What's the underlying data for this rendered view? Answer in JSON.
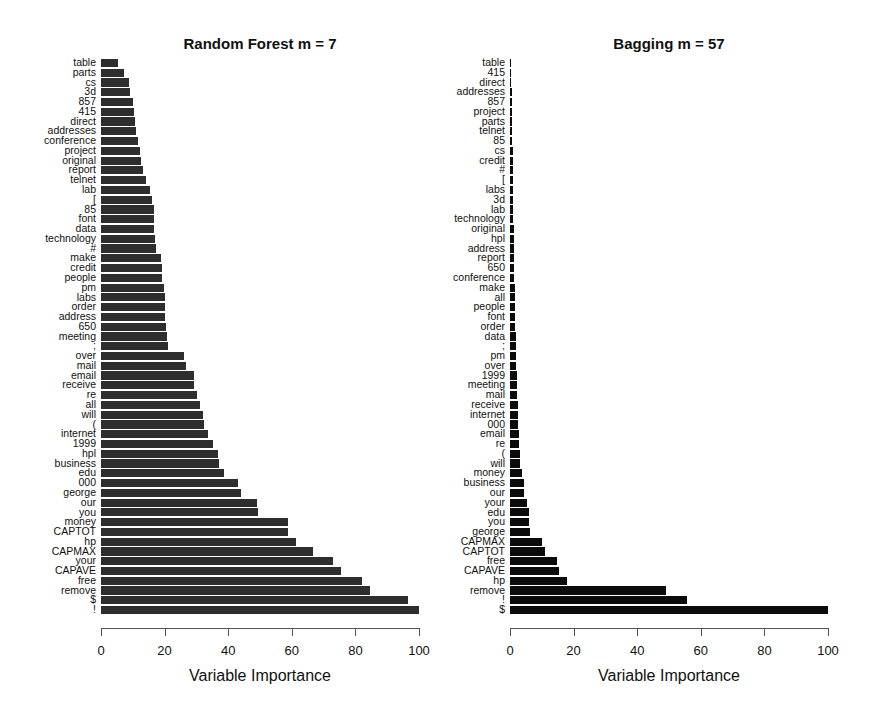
{
  "chart_data": [
    {
      "type": "bar",
      "orientation": "horizontal",
      "title": "Random Forest m = 7",
      "xlabel": "Variable Importance",
      "ylabel": "",
      "xlim": [
        0,
        100
      ],
      "xticks": [
        0,
        20,
        40,
        60,
        80,
        100
      ],
      "grid": false,
      "legend": null,
      "bar_color": "#2e2e2e",
      "categories": [
        "table",
        "parts",
        "cs",
        "3d",
        "857",
        "415",
        "direct",
        "addresses",
        "conference",
        "project",
        "original",
        "report",
        "telnet",
        "lab",
        "[",
        "85",
        "font",
        "data",
        "technology",
        "#",
        "make",
        "credit",
        "people",
        "pm",
        "labs",
        "order",
        "address",
        "650",
        "meeting",
        ";",
        "over",
        "mail",
        "email",
        "receive",
        "re",
        "all",
        "will",
        "(",
        "internet",
        "1999",
        "hpl",
        "business",
        "edu",
        "000",
        "george",
        "our",
        "you",
        "money",
        "CAPTOT",
        "hp",
        "CAPMAX",
        "your",
        "CAPAVE",
        "free",
        "remove",
        "$",
        "!"
      ],
      "values": [
        5.3,
        7.2,
        8.8,
        9.1,
        10.0,
        10.4,
        10.7,
        11.0,
        11.6,
        12.3,
        12.6,
        13.2,
        14.0,
        15.4,
        16.0,
        16.7,
        16.7,
        16.7,
        17.0,
        17.3,
        18.9,
        19.2,
        19.2,
        19.8,
        20.0,
        20.2,
        20.2,
        20.4,
        20.8,
        21.1,
        26.1,
        26.7,
        29.2,
        29.2,
        30.2,
        31.1,
        32.0,
        32.4,
        33.6,
        35.2,
        36.8,
        37.1,
        38.7,
        43.0,
        44.0,
        49.0,
        49.3,
        58.8,
        58.8,
        61.3,
        66.7,
        72.9,
        75.5,
        82.0,
        84.6,
        96.5,
        100.0
      ]
    },
    {
      "type": "bar",
      "orientation": "horizontal",
      "title": "Bagging m = 57",
      "xlabel": "Variable Importance",
      "ylabel": "",
      "xlim": [
        0,
        100
      ],
      "xticks": [
        0,
        20,
        40,
        60,
        80,
        100
      ],
      "grid": false,
      "legend": null,
      "bar_color": "#0b0b0b",
      "categories": [
        "table",
        "415",
        "direct",
        "addresses",
        "857",
        "project",
        "parts",
        "telnet",
        "85",
        "cs",
        "credit",
        "#",
        "[",
        "labs",
        "3d",
        "lab",
        "technology",
        "original",
        "hpl",
        "address",
        "report",
        "650",
        "conference",
        "make",
        "all",
        "people",
        "font",
        "order",
        "data",
        ";",
        "pm",
        "over",
        "1999",
        "meeting",
        "mail",
        "receive",
        "internet",
        "000",
        "email",
        "re",
        "(",
        "will",
        "money",
        "business",
        "our",
        "your",
        "edu",
        "you",
        "george",
        "CAPMAX",
        "CAPTOT",
        "free",
        "CAPAVE",
        "hp",
        "remove",
        "!",
        "$"
      ],
      "values": [
        0.3,
        0.4,
        0.4,
        0.5,
        0.5,
        0.6,
        0.6,
        0.7,
        0.7,
        0.8,
        0.8,
        0.9,
        0.9,
        1.0,
        1.0,
        1.1,
        1.1,
        1.2,
        1.2,
        1.3,
        1.3,
        1.4,
        1.4,
        1.5,
        1.6,
        1.6,
        1.7,
        1.7,
        1.8,
        1.9,
        1.9,
        2.0,
        2.1,
        2.2,
        2.3,
        2.4,
        2.4,
        2.5,
        2.7,
        2.8,
        3.0,
        3.3,
        3.8,
        4.3,
        4.3,
        5.5,
        5.9,
        6.1,
        6.3,
        10.2,
        11.1,
        14.8,
        15.4,
        18.0,
        49.0,
        55.7,
        100.0
      ]
    }
  ]
}
